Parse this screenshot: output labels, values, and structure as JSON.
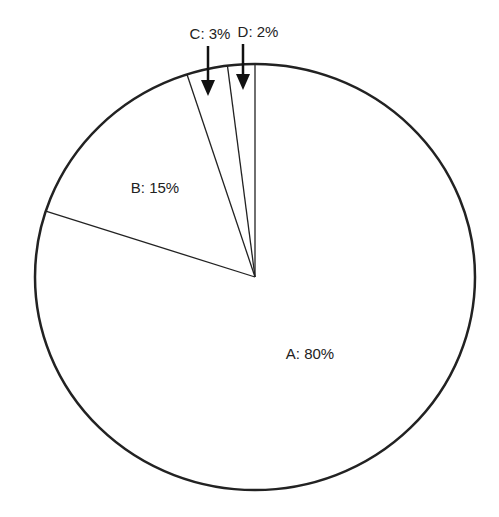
{
  "chart_data": {
    "type": "pie",
    "title": "",
    "categories": [
      "A",
      "B",
      "C",
      "D"
    ],
    "values": [
      80,
      15,
      3,
      2
    ],
    "labels": [
      "A: 80%",
      "B: 15%",
      "C: 3%",
      "D: 2%"
    ],
    "start_angle": "12 o'clock",
    "direction": "clockwise",
    "fill_color": "#ffffff",
    "stroke_color": "#222222",
    "legend": "none",
    "annotations": [
      {
        "label": "C: 3%",
        "arrow": true
      },
      {
        "label": "D: 2%",
        "arrow": true
      }
    ]
  }
}
